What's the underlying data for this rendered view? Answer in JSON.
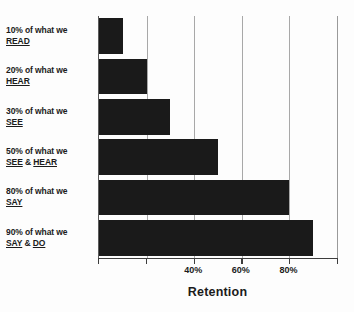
{
  "chart_data": {
    "type": "bar",
    "orientation": "horizontal",
    "title": "",
    "xlabel": "Retention",
    "ylabel": "",
    "categories": [
      "10% of what we READ",
      "20% of what we HEAR",
      "30% of what we SEE",
      "50% of what we SEE & HEAR",
      "80% of what we SAY",
      "90% of what we SAY & DO"
    ],
    "values": [
      10,
      20,
      30,
      50,
      80,
      90
    ],
    "xlim": [
      0,
      100
    ],
    "xticks": [
      0,
      20,
      40,
      60,
      80,
      100
    ],
    "xticklabels": [
      "",
      "",
      "40%",
      "60%",
      "80%",
      ""
    ],
    "grid": true,
    "legend": false,
    "bar_color": "#1a1a1a",
    "background_color": "#ffffff",
    "gridline_color": "#a8a8a8"
  },
  "labels": [
    {
      "line1": "10% of what we",
      "underlined": "READ",
      "suffix": "",
      "middle": ""
    },
    {
      "line1": "20% of what we",
      "underlined": "HEAR",
      "suffix": "",
      "middle": ""
    },
    {
      "line1": "30% of what we",
      "underlined": "SEE",
      "suffix": "",
      "middle": ""
    },
    {
      "line1": "50% of what we",
      "underlined": "SEE",
      "middle": " & ",
      "suffix": "HEAR"
    },
    {
      "line1": "80% of what we",
      "underlined": "SAY",
      "suffix": "",
      "middle": ""
    },
    {
      "line1": "90% of what we",
      "underlined": "SAY",
      "middle": " & ",
      "suffix": "DO"
    }
  ],
  "axis": {
    "title": "Retention",
    "tick_labels": [
      {
        "text": "40%",
        "value": 40
      },
      {
        "text": "60%",
        "value": 60
      },
      {
        "text": "80%",
        "value": 80
      }
    ]
  }
}
